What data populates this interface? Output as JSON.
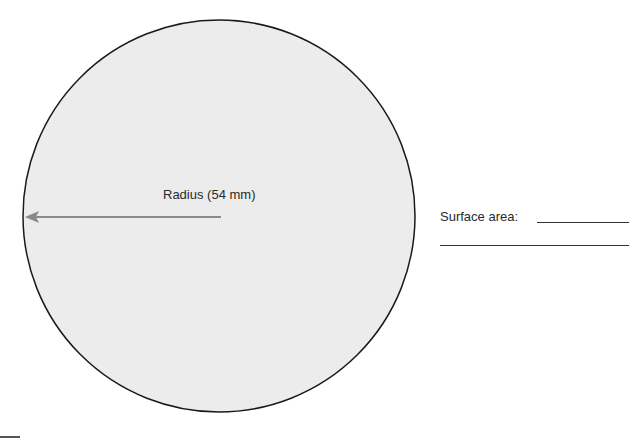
{
  "diagram": {
    "shape": "circle",
    "fill_color": "#ececec",
    "stroke_color": "#1a1a1a",
    "arrow_color": "#8a8a8a",
    "radius_label": "Radius (54 mm)"
  },
  "worksheet": {
    "surface_area_label": "Surface area:",
    "answer_lines": 2
  }
}
